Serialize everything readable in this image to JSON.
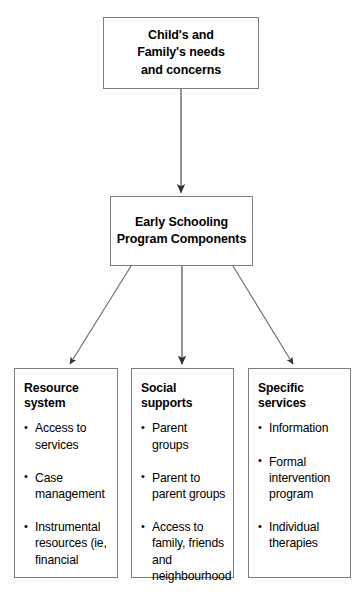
{
  "diagram": {
    "type": "flowchart",
    "line_color": "#7d7d7d",
    "text_color": "#000000",
    "background": "#ffffff",
    "nodes": {
      "root": {
        "text": "Child's and\nFamily's needs\nand concerns",
        "line1": "Child's and",
        "line2": "Family's needs",
        "line3": "and concerns"
      },
      "program": {
        "line1": "Early Schooling",
        "line2": "Program Components"
      },
      "columns": [
        {
          "heading": "Resource system",
          "items": [
            "Access to services",
            "Case management",
            "Instrumental resources (ie, financial"
          ]
        },
        {
          "heading": "Social supports",
          "items": [
            "Parent groups",
            "Parent to parent groups",
            "Access to family, friends and neighbourhood"
          ]
        },
        {
          "heading": "Specific services",
          "items": [
            "Information",
            "Formal intervention program",
            "Individual therapies"
          ]
        }
      ]
    },
    "connectors": [
      {
        "name": "root-to-program",
        "style": "straight-vertical-arrow"
      },
      {
        "name": "program-to-resource-system",
        "style": "diagonal-arrow-left"
      },
      {
        "name": "program-to-social-supports",
        "style": "straight-vertical-arrow"
      },
      {
        "name": "program-to-specific-services",
        "style": "diagonal-arrow-right"
      }
    ]
  }
}
